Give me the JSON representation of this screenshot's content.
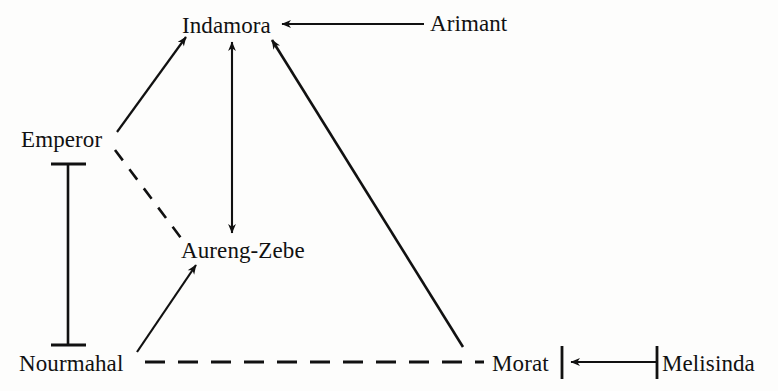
{
  "diagram": {
    "background_color": "#fdfdfc",
    "line_color": "#111111",
    "nodes": [
      {
        "id": "indamora",
        "label": "Indamora",
        "x": 229,
        "y": 26
      },
      {
        "id": "arimant",
        "label": "Arimant",
        "x": 475,
        "y": 24
      },
      {
        "id": "emperor",
        "label": "Emperor",
        "x": 67,
        "y": 140
      },
      {
        "id": "aurengzebe",
        "label": "Aureng-Zebe",
        "x": 248,
        "y": 251
      },
      {
        "id": "nourmahal",
        "label": "Nourmahal",
        "x": 77,
        "y": 364
      },
      {
        "id": "morat",
        "label": "Morat",
        "x": 524,
        "y": 364
      },
      {
        "id": "melisinda",
        "label": "Melisinda",
        "x": 718,
        "y": 364
      }
    ],
    "edges": [
      {
        "id": "emperor-indamora",
        "from": "emperor",
        "to": "indamora",
        "style": "solid",
        "arrow": "single",
        "x1": 117,
        "y1": 132,
        "x2": 186,
        "y2": 37
      },
      {
        "id": "emperor-aurengzebe",
        "from": "emperor",
        "to": "aurengzebe",
        "style": "dashed",
        "arrow": "none",
        "x1": 115,
        "y1": 150,
        "x2": 181,
        "y2": 238
      },
      {
        "id": "indamora-aurengzebe",
        "from": "indamora",
        "to": "aurengzebe",
        "style": "solid",
        "arrow": "double",
        "x1": 232,
        "y1": 42,
        "x2": 232,
        "y2": 233
      },
      {
        "id": "arimant-indamora",
        "from": "arimant",
        "to": "indamora",
        "style": "solid",
        "arrow": "single",
        "x1": 424,
        "y1": 24,
        "x2": 282,
        "y2": 24
      },
      {
        "id": "morat-indamora",
        "from": "morat",
        "to": "indamora",
        "style": "solid",
        "arrow": "single",
        "x1": 463,
        "y1": 347,
        "x2": 272,
        "y2": 40
      },
      {
        "id": "nourmahal-aurengzebe",
        "from": "nourmahal",
        "to": "aurengzebe",
        "style": "solid",
        "arrow": "single",
        "x1": 137,
        "y1": 352,
        "x2": 196,
        "y2": 265
      },
      {
        "id": "nourmahal-morat",
        "from": "nourmahal",
        "to": "morat",
        "style": "dashed",
        "arrow": "none",
        "x1": 145,
        "y1": 362,
        "x2": 484,
        "y2": 362
      },
      {
        "id": "emperor-nourmahal",
        "from": "emperor",
        "to": "nourmahal",
        "style": "solid",
        "arrow": "none",
        "cap_start": "bar-horizontal",
        "cap_end": "bar-horizontal",
        "x1": 68,
        "y1": 163,
        "x2": 68,
        "y2": 346
      },
      {
        "id": "melisinda-morat",
        "from": "melisinda",
        "to": "morat",
        "style": "solid",
        "arrow": "single",
        "cap_start": "bar-vertical",
        "cap_end": "bar-vertical",
        "x1": 659,
        "y1": 362,
        "x2": 571,
        "y2": 362
      }
    ]
  }
}
